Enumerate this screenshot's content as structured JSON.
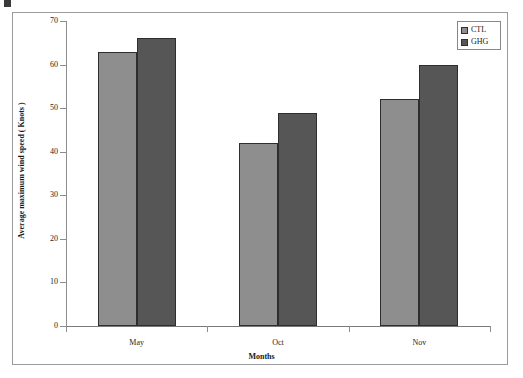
{
  "chart_data": {
    "type": "bar",
    "title": "",
    "subtitle": "",
    "xlabel": "Months",
    "ylabel": "Average maximum wind speed ( Knots )",
    "categories": [
      "May",
      "Oct",
      "Nov"
    ],
    "series": [
      {
        "name": "CTL",
        "color": "#8e8e8e",
        "values": [
          63,
          42,
          52
        ]
      },
      {
        "name": "GHG",
        "color": "#565656",
        "values": [
          66,
          49,
          60
        ]
      }
    ],
    "ylim": [
      0,
      70
    ],
    "ytick_values": [
      0,
      10,
      20,
      30,
      40,
      50,
      60,
      70
    ],
    "ytick_labels": [
      "0",
      "10",
      "20",
      "30",
      "40",
      "50",
      "60",
      "70"
    ],
    "grid": false,
    "legend_position": "top-right",
    "legend_entries": [
      {
        "label": "CTL",
        "swatch": "legend-swatch-ctl",
        "color": "#8e8e8e"
      },
      {
        "label": "GHG",
        "swatch": "legend-swatch-ghg",
        "color": "#565656"
      }
    ],
    "axis_line_color": "#8d8d8d",
    "bar_border_color": "#2e2e2e",
    "frame_color": "#9a9a9a",
    "background": "#ffffff"
  }
}
